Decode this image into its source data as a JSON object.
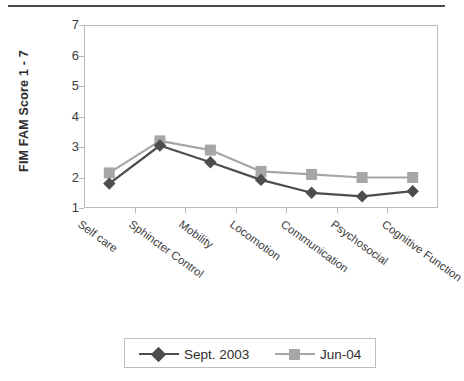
{
  "chart_data": {
    "type": "line",
    "title": "",
    "xlabel": "",
    "ylabel": "FIM FAM Score 1 - 7",
    "ylim": [
      1,
      7
    ],
    "yticks": [
      1,
      2,
      3,
      4,
      5,
      6,
      7
    ],
    "grid": false,
    "legend_position": "bottom",
    "categories": [
      "Self care",
      "Sphincter Control",
      "Mobility",
      "Locomotion",
      "Communication",
      "Psychosocial",
      "Cognitive Function"
    ],
    "series": [
      {
        "name": "Sept. 2003",
        "color": "#4d4d4d",
        "marker": "diamond",
        "values": [
          1.8,
          3.05,
          2.5,
          1.92,
          1.5,
          1.38,
          1.55
        ]
      },
      {
        "name": "Jun-04",
        "color": "#a6a6a6",
        "marker": "square",
        "values": [
          2.15,
          3.2,
          2.9,
          2.2,
          2.1,
          2.0,
          2.0
        ]
      }
    ]
  },
  "axis": {
    "y_title": "FIM FAM Score 1 - 7",
    "y_tick_labels": [
      "7",
      "6",
      "5",
      "4",
      "3",
      "2",
      "1"
    ]
  },
  "legend": {
    "entries": [
      {
        "label": "Sept. 2003"
      },
      {
        "label": "Jun-04"
      }
    ]
  },
  "colors": {
    "series_1": "#4d4d4d",
    "series_2": "#a6a6a6",
    "axis": "#b9b9b9",
    "text": "#3d3d3d",
    "rule": "#4a4a4a"
  }
}
